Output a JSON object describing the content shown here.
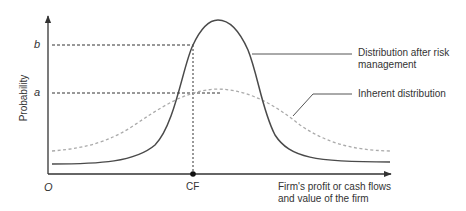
{
  "diagram": {
    "y_axis_label": "Probability",
    "x_axis_label_line1": "Firm's profit or cash flows",
    "x_axis_label_line2": "and value of the firm",
    "origin_label": "O",
    "cf_label": "CF",
    "level_b_label": "b",
    "level_a_label": "a",
    "curves": [
      {
        "name": "Distribution after risk management",
        "label_line1": "Distribution after risk",
        "label_line2": "management",
        "style": "solid",
        "color": "#4a4a4a"
      },
      {
        "name": "Inherent distribution",
        "label_line1": "Inherent distribution",
        "style": "dashed",
        "color": "#aaaaaa"
      }
    ],
    "guide_color": "#333333"
  }
}
